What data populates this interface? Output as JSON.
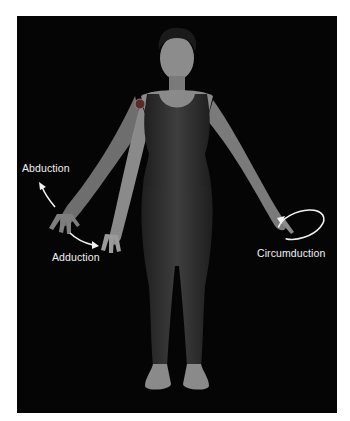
{
  "figure": {
    "background": "#050505",
    "page_background": "#ffffff",
    "label_color": "#f2f2f2",
    "marker_color": "#5a2a2a",
    "labels": {
      "abduction": "Abduction",
      "adduction": "Adduction",
      "circumduction": "Circumduction"
    },
    "icons": {
      "abduction_arrow": "curved-arrow-up-left",
      "adduction_arrow": "curved-arrow-down-right",
      "circumduction_arrow": "elliptical-arrow",
      "joint_marker": "shoulder-joint-dot"
    }
  }
}
